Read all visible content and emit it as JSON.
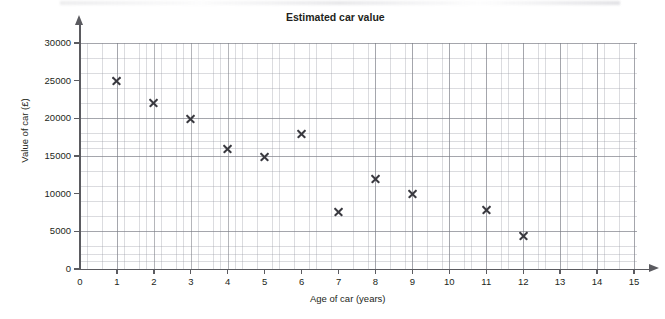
{
  "chart_data": {
    "type": "scatter",
    "title": "Estimated car value",
    "xlabel": "Age of car (years)",
    "ylabel": "Value of car (£)",
    "xlim": [
      0,
      15
    ],
    "ylim": [
      0,
      30000
    ],
    "grid": true,
    "legend": "none",
    "x_ticks": [
      "0",
      "1",
      "2",
      "3",
      "4",
      "5",
      "6",
      "7",
      "8",
      "9",
      "10",
      "11",
      "12",
      "13",
      "14",
      "15"
    ],
    "y_ticks": [
      "0",
      "5000",
      "10000",
      "15000",
      "20000",
      "25000",
      "30000"
    ],
    "x_tick_values": [
      0,
      1,
      2,
      3,
      4,
      5,
      6,
      7,
      8,
      9,
      10,
      11,
      12,
      13,
      14,
      15
    ],
    "y_tick_values": [
      0,
      5000,
      10000,
      15000,
      20000,
      25000,
      30000
    ],
    "x_major_step": 1,
    "x_minor_step": 0.2,
    "y_major_step": 5000,
    "y_minor_step": 1000,
    "marker": "x",
    "marker_color": "#3a3a40",
    "grid_major_color": "#787a82",
    "grid_minor_color": "#9698a2",
    "axis_color": "#5b5b60",
    "text_color": "#231f20",
    "points": [
      {
        "x": 1,
        "y": 25000
      },
      {
        "x": 2,
        "y": 22000
      },
      {
        "x": 3,
        "y": 20000
      },
      {
        "x": 4,
        "y": 16000
      },
      {
        "x": 5,
        "y": 14900
      },
      {
        "x": 6,
        "y": 18000
      },
      {
        "x": 7,
        "y": 7600
      },
      {
        "x": 8,
        "y": 12000
      },
      {
        "x": 9,
        "y": 10000
      },
      {
        "x": 11,
        "y": 7800
      },
      {
        "x": 12,
        "y": 4400
      }
    ],
    "x": [
      1,
      2,
      3,
      4,
      5,
      6,
      7,
      8,
      9,
      11,
      12
    ],
    "values": [
      25000,
      22000,
      20000,
      16000,
      14900,
      18000,
      7600,
      12000,
      10000,
      7800,
      4400
    ]
  }
}
